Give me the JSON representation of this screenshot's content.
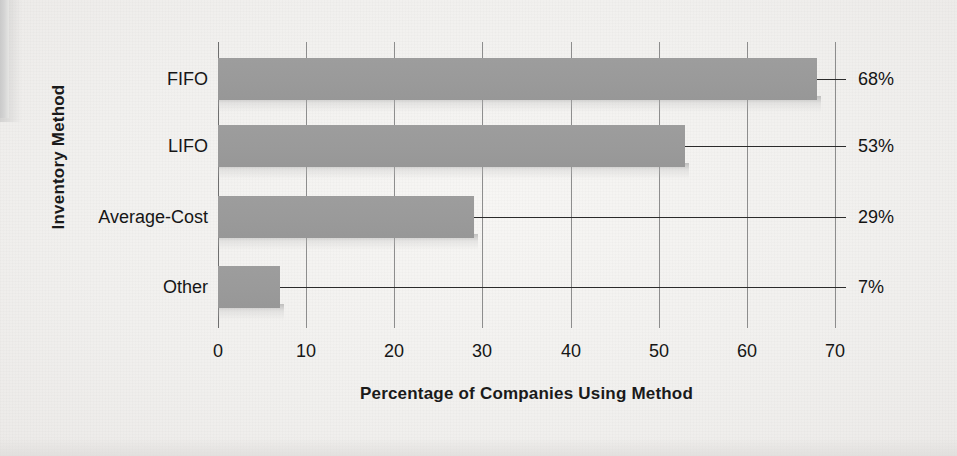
{
  "chart_data": {
    "type": "bar",
    "orientation": "horizontal",
    "title": "",
    "xlabel": "Percentage of Companies Using Method",
    "ylabel": "Inventory Method",
    "categories": [
      "FIFO",
      "LIFO",
      "Average-Cost",
      "Other"
    ],
    "values": [
      68,
      53,
      29,
      7
    ],
    "data_labels": [
      "68%",
      "53%",
      "29%",
      "7%"
    ],
    "xlim": [
      0,
      70
    ],
    "xticks": [
      0,
      10,
      20,
      30,
      40,
      50,
      60,
      70
    ],
    "xtick_labels": [
      "0",
      "10",
      "20",
      "30",
      "40",
      "50",
      "60",
      "70"
    ],
    "grid": "vertical",
    "legend": "none",
    "bar_color": "#9a9a9a",
    "background_color": "#f3f2f0",
    "text_color": "#161616"
  },
  "axis": {
    "y_title": "Inventory Method",
    "x_title": "Percentage of Companies Using Method"
  },
  "bars": [
    {
      "category": "FIFO",
      "value": 68,
      "label": "68%"
    },
    {
      "category": "LIFO",
      "value": 53,
      "label": "53%"
    },
    {
      "category": "Average-Cost",
      "value": 29,
      "label": "29%"
    },
    {
      "category": "Other",
      "value": 7,
      "label": "7%"
    }
  ],
  "xticks": [
    {
      "label": "0"
    },
    {
      "label": "10"
    },
    {
      "label": "20"
    },
    {
      "label": "30"
    },
    {
      "label": "40"
    },
    {
      "label": "50"
    },
    {
      "label": "60"
    },
    {
      "label": "70"
    }
  ]
}
